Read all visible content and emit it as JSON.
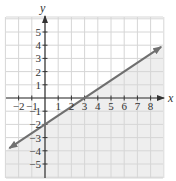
{
  "chart_data": {
    "type": "line",
    "title": "",
    "xlabel": "x",
    "ylabel": "y",
    "xlim": [
      -3,
      9
    ],
    "ylim": [
      -6,
      6
    ],
    "grid": true,
    "x_ticks": [
      -2,
      -1,
      1,
      2,
      3,
      4,
      5,
      6,
      7,
      8
    ],
    "y_ticks": [
      5,
      4,
      3,
      2,
      1,
      -1,
      -2,
      -3,
      -4,
      -5
    ],
    "x_tick_labels": [
      "−2",
      "−1",
      "1",
      "2",
      "3",
      "4",
      "5",
      "6",
      "7",
      "8"
    ],
    "y_tick_labels": [
      "5",
      "4",
      "3",
      "2",
      "1",
      "−1",
      "−2",
      "−3",
      "−4",
      "−5"
    ],
    "series": [
      {
        "name": "boundary line",
        "equation": "y = (2/3)x - 2",
        "slope": 0.6667,
        "y_intercept": -2,
        "x_intercept": 3,
        "points": [
          [
            -2.7,
            -3.8
          ],
          [
            0,
            -2
          ],
          [
            3,
            0
          ],
          [
            8.8,
            3.87
          ]
        ],
        "style": "solid",
        "arrows": "both"
      }
    ],
    "shaded_region": "below line",
    "colors": {
      "line": "#707070",
      "shade": "#eeeeee",
      "grid": "#d6d6d6",
      "axis": "#333333"
    }
  }
}
